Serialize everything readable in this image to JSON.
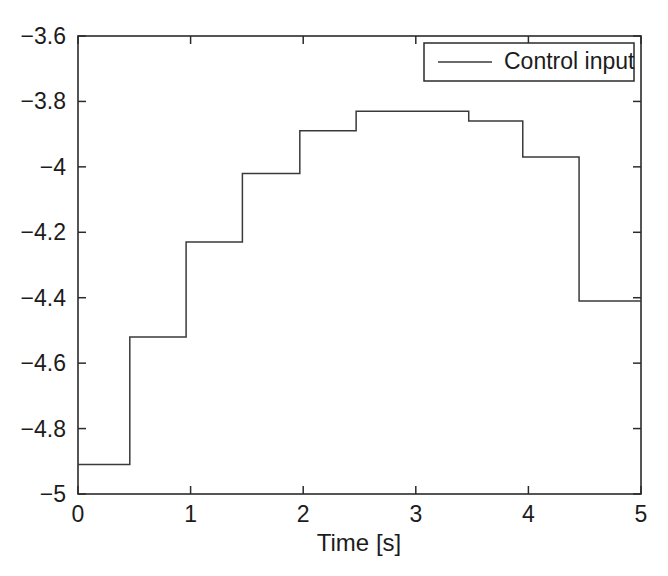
{
  "chart_data": {
    "type": "line",
    "title": "",
    "subtitle": "",
    "xlabel": "Time [s]",
    "ylabel": "",
    "xlim": [
      0,
      5
    ],
    "ylim": [
      -5,
      -3.6
    ],
    "grid": false,
    "line_style": "step-post",
    "legend_position": "top-right",
    "legend": [
      "Control input"
    ],
    "xticks": [
      0,
      1,
      2,
      3,
      4,
      5
    ],
    "xtick_labels": [
      "0",
      "1",
      "2",
      "3",
      "4",
      "5"
    ],
    "yticks": [
      -5,
      -4.8,
      -4.6,
      -4.4,
      -4.2,
      -4,
      -3.8,
      -3.6
    ],
    "ytick_labels": [
      "-5",
      "-4.8",
      "-4.6",
      "-4.4",
      "-4.2",
      "-4",
      "-3.8",
      "-3.6"
    ],
    "series": [
      {
        "name": "Control input",
        "color": "#3a3a3a",
        "x": [
          0.0,
          0.46,
          0.96,
          1.46,
          1.97,
          2.47,
          2.97,
          3.47,
          3.95,
          4.45,
          5.0
        ],
        "values": [
          -4.91,
          -4.52,
          -4.23,
          -4.02,
          -3.89,
          -3.83,
          -3.83,
          -3.86,
          -3.97,
          -4.15,
          -4.41
        ],
        "step_segments": [
          {
            "t_start": 0.0,
            "t_end": 0.46,
            "value": -4.91
          },
          {
            "t_start": 0.46,
            "t_end": 0.96,
            "value": -4.52
          },
          {
            "t_start": 0.96,
            "t_end": 1.46,
            "value": -4.23
          },
          {
            "t_start": 1.46,
            "t_end": 1.97,
            "value": -4.02
          },
          {
            "t_start": 1.97,
            "t_end": 2.47,
            "value": -3.89
          },
          {
            "t_start": 2.47,
            "t_end": 2.97,
            "value": -3.83
          },
          {
            "t_start": 2.97,
            "t_end": 3.47,
            "value": -3.83
          },
          {
            "t_start": 3.47,
            "t_end": 3.95,
            "value": -3.86
          },
          {
            "t_start": 3.95,
            "t_end": 4.45,
            "value": -3.97
          },
          {
            "t_start": 4.45,
            "t_end": 5.0,
            "value": -4.41
          }
        ]
      }
    ]
  },
  "axes": {
    "x_title": "Time [s]",
    "x_tick_labels": [
      "0",
      "1",
      "2",
      "3",
      "4",
      "5"
    ],
    "y_tick_labels": [
      "-3.6",
      "-3.8",
      "-4",
      "-4.2",
      "-4.4",
      "-4.6",
      "-4.8",
      "-5"
    ]
  },
  "legend": {
    "entries": [
      {
        "label": "Control input",
        "color": "#3a3a3a"
      }
    ]
  },
  "colors": {
    "line": "#3a3a3a",
    "axis": "#2b2b2b",
    "text": "#1c1c1c",
    "background": "#ffffff"
  }
}
